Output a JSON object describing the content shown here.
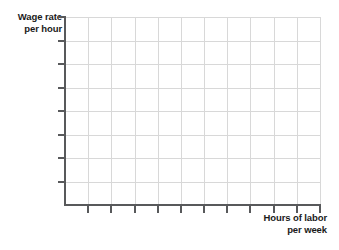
{
  "figure": {
    "kind": "blank-coordinate-grid",
    "background_color": "#ffffff",
    "axis_color": "#58595b",
    "grid_color": "#d8d8d8",
    "label_color": "#1a1a1a"
  },
  "y_axis_label": {
    "line1": "Wage rate",
    "line2": "per hour"
  },
  "x_axis_label": {
    "line1": "Hours of labor",
    "line2": "per week"
  },
  "chart_data": {
    "type": "line",
    "title": "",
    "subtitle": "",
    "xlabel": "Hours of labor per week",
    "ylabel": "Wage rate per hour",
    "series": [],
    "x": [],
    "values": [],
    "xticklabels": [],
    "yticklabels": [],
    "xlim": [
      0,
      11
    ],
    "ylim": [
      0,
      8
    ],
    "grid": true,
    "legend": false,
    "legend_position": "none",
    "annotations": [],
    "note": "Empty graph template: gridded plotting area with labeled axes and no plotted data.",
    "grid_columns": 11,
    "grid_rows": 8,
    "x_tick_count": 11,
    "y_tick_count": 8
  }
}
